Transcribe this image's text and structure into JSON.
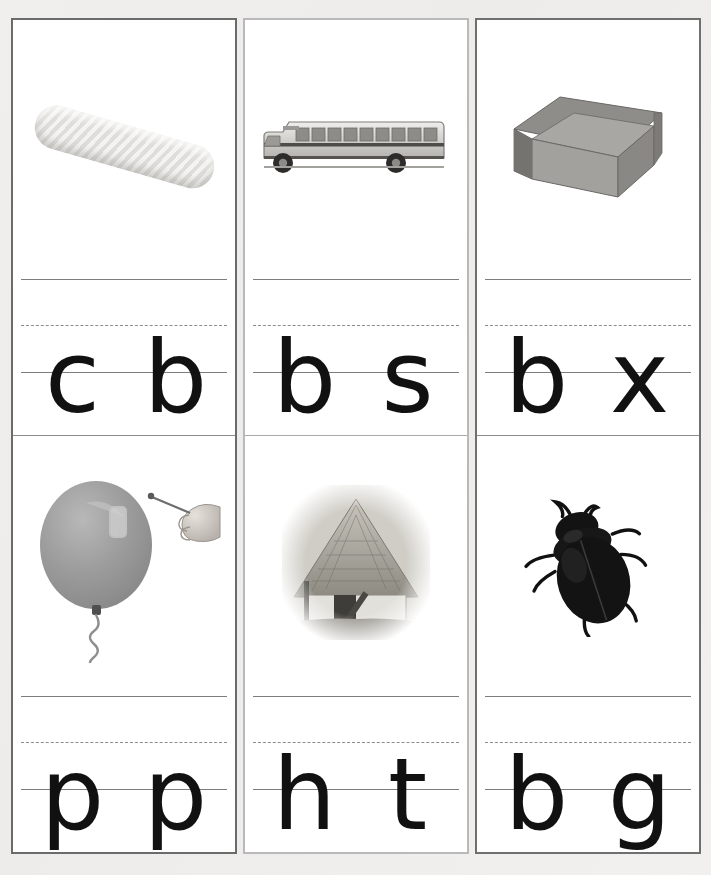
{
  "worksheet": {
    "title": "Beginning sounds letter writing worksheet",
    "background_color": "#eeecea",
    "card_border_color": "#6b6b6b",
    "line_color": "#7d7d7d",
    "letter_color": "#111111",
    "columns": [
      {
        "index": 1,
        "cells": [
          {
            "position": "top",
            "picture": {
              "name": "corn-cob",
              "label": "corn cob"
            },
            "letters": [
              "c",
              "b"
            ]
          },
          {
            "position": "bottom",
            "picture": {
              "name": "balloon-with-pin",
              "label": "balloon and hand holding a pin"
            },
            "letters": [
              "p",
              "p"
            ]
          }
        ]
      },
      {
        "index": 2,
        "cells": [
          {
            "position": "top",
            "picture": {
              "name": "school-bus",
              "label": "school bus"
            },
            "letters": [
              "b",
              "s"
            ]
          },
          {
            "position": "bottom",
            "picture": {
              "name": "thatched-hut",
              "label": "thatched roof hut"
            },
            "letters": [
              "h",
              "t"
            ]
          }
        ]
      },
      {
        "index": 3,
        "cells": [
          {
            "position": "top",
            "picture": {
              "name": "open-box",
              "label": "open cardboard box"
            },
            "letters": [
              "b",
              "x"
            ]
          },
          {
            "position": "bottom",
            "picture": {
              "name": "beetle",
              "label": "black beetle bug"
            },
            "letters": [
              "b",
              "g"
            ]
          }
        ]
      }
    ]
  }
}
